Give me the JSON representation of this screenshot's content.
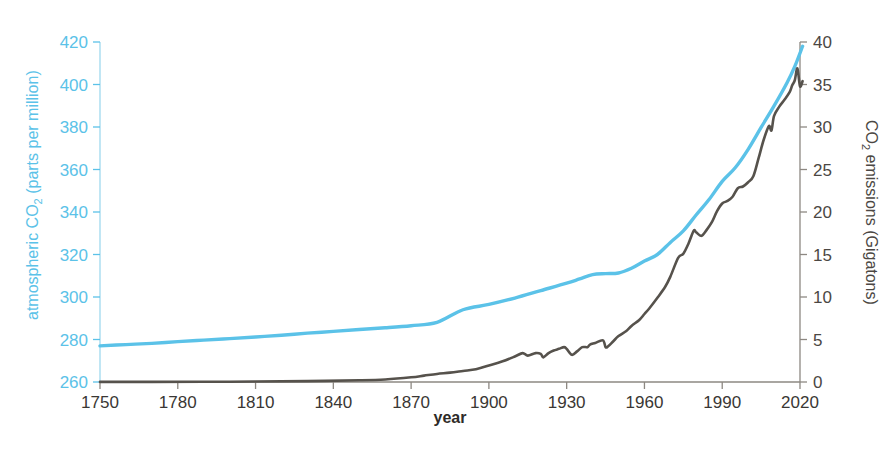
{
  "chart_data": {
    "type": "line",
    "title": "",
    "subtitle": "",
    "xlabel": "year",
    "xlim": [
      1750,
      2020
    ],
    "grid": false,
    "legend": "none",
    "background_color": "#ffffff",
    "x_ticks": [
      1750,
      1780,
      1810,
      1840,
      1870,
      1900,
      1930,
      1960,
      1990,
      2020
    ],
    "x_tick_labels": [
      "1750",
      "1780",
      "1810",
      "1840",
      "1870",
      "1900",
      "1930",
      "1960",
      "1990",
      "2020"
    ],
    "axes": {
      "left": {
        "label_prefix": "atmospheric CO",
        "label_sub": "2",
        "label_suffix": " (parts per million)",
        "label_full": "atmospheric CO2 (parts per million)",
        "color": "#5bc2e8",
        "ylim": [
          260,
          420
        ],
        "ticks": [
          260,
          280,
          300,
          320,
          340,
          360,
          380,
          400,
          420
        ],
        "tick_labels": [
          "260",
          "280",
          "300",
          "320",
          "340",
          "360",
          "380",
          "400",
          "420"
        ]
      },
      "right": {
        "label_prefix": "CO",
        "label_sub": "2",
        "label_suffix": " emissions (Gigatons)",
        "label_full": "CO2 emissions (Gigatons)",
        "color": "#4b4743",
        "ylim": [
          0,
          40
        ],
        "ticks": [
          0,
          5,
          10,
          15,
          20,
          25,
          30,
          35,
          40
        ],
        "tick_labels": [
          "0",
          "5",
          "10",
          "15",
          "20",
          "25",
          "30",
          "35",
          "40"
        ]
      }
    },
    "series": [
      {
        "name": "atmospheric CO2 (parts per million)",
        "axis": "left",
        "color": "#5bc2e8",
        "width": 3.4,
        "x": [
          1750,
          1760,
          1770,
          1780,
          1790,
          1800,
          1810,
          1820,
          1830,
          1840,
          1850,
          1860,
          1870,
          1880,
          1890,
          1900,
          1910,
          1920,
          1930,
          1935,
          1940,
          1945,
          1950,
          1955,
          1960,
          1965,
          1970,
          1975,
          1980,
          1985,
          1990,
          1995,
          2000,
          2005,
          2010,
          2015,
          2018,
          2021
        ],
        "values": [
          277.0,
          277.6,
          278.2,
          279.0,
          279.7,
          280.4,
          281.2,
          282.0,
          283.0,
          283.8,
          284.7,
          285.5,
          286.5,
          288.1,
          294.0,
          296.5,
          299.5,
          303.0,
          306.5,
          308.5,
          310.5,
          311.0,
          311.3,
          313.5,
          316.9,
          320.0,
          325.7,
          331.1,
          338.7,
          346.0,
          354.4,
          360.8,
          369.5,
          379.8,
          389.9,
          400.8,
          408.5,
          418.0
        ]
      },
      {
        "name": "CO2 emissions (Gigatons)",
        "axis": "right",
        "color": "#56524c",
        "width": 2.6,
        "x": [
          1750,
          1770,
          1790,
          1810,
          1830,
          1850,
          1860,
          1870,
          1875,
          1880,
          1885,
          1890,
          1895,
          1900,
          1905,
          1910,
          1913,
          1915,
          1918,
          1920,
          1921,
          1923,
          1925,
          1927,
          1929,
          1930,
          1932,
          1934,
          1936,
          1938,
          1939,
          1941,
          1944,
          1945,
          1946,
          1948,
          1950,
          1953,
          1955,
          1958,
          1960,
          1962,
          1965,
          1968,
          1970,
          1973,
          1975,
          1977,
          1979,
          1980,
          1982,
          1984,
          1986,
          1988,
          1990,
          1992,
          1994,
          1996,
          1998,
          2000,
          2002,
          2004,
          2006,
          2008,
          2009,
          2010,
          2012,
          2014,
          2016,
          2017,
          2018,
          2019,
          2020,
          2021
        ],
        "values": [
          0.01,
          0.02,
          0.03,
          0.05,
          0.1,
          0.2,
          0.3,
          0.55,
          0.75,
          0.95,
          1.1,
          1.3,
          1.5,
          1.95,
          2.4,
          3.0,
          3.4,
          3.1,
          3.4,
          3.3,
          2.9,
          3.4,
          3.7,
          3.9,
          4.1,
          3.9,
          3.2,
          3.6,
          4.1,
          4.1,
          4.4,
          4.6,
          4.9,
          4.1,
          4.2,
          4.8,
          5.4,
          6.0,
          6.6,
          7.3,
          8.0,
          8.7,
          9.9,
          11.2,
          12.4,
          14.6,
          15.1,
          16.3,
          17.8,
          17.6,
          17.2,
          17.9,
          18.8,
          20.1,
          21.0,
          21.3,
          21.8,
          22.8,
          23.0,
          23.5,
          24.2,
          26.3,
          28.5,
          30.1,
          29.6,
          31.3,
          32.4,
          33.2,
          34.1,
          34.9,
          35.5,
          36.9,
          34.8,
          35.4
        ]
      }
    ]
  },
  "plot_geometry": {
    "left_px": 100,
    "right_px": 800,
    "top_px": 42,
    "bottom_px": 382
  }
}
